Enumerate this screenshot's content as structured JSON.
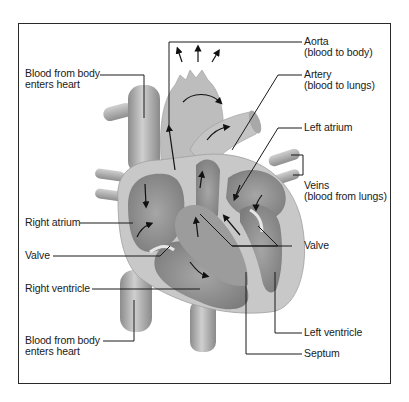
{
  "diagram": {
    "labels": {
      "blood_from_body_top": [
        "Blood from body",
        "enters heart"
      ],
      "aorta": [
        "Aorta",
        "(blood to body)"
      ],
      "artery": [
        "Artery",
        "(blood to lungs)"
      ],
      "left_atrium": [
        "Left atrium"
      ],
      "veins": [
        "Veins",
        "(blood from lungs)"
      ],
      "right_atrium": [
        "Right atrium"
      ],
      "valve_left": [
        "Valve"
      ],
      "valve_right": [
        "Valve"
      ],
      "right_ventricle": [
        "Right ventricle"
      ],
      "blood_from_body_bottom": [
        "Blood from body",
        "enters heart"
      ],
      "left_ventricle": [
        "Left ventricle"
      ],
      "septum": [
        "Septum"
      ]
    },
    "colors": {
      "frame": "#2a2a2a",
      "tissue_light": "#c9c9c9",
      "tissue_mid": "#a9a9a9",
      "tissue_dark": "#7e7e7e",
      "leader_line": "#1a1a1a"
    }
  }
}
